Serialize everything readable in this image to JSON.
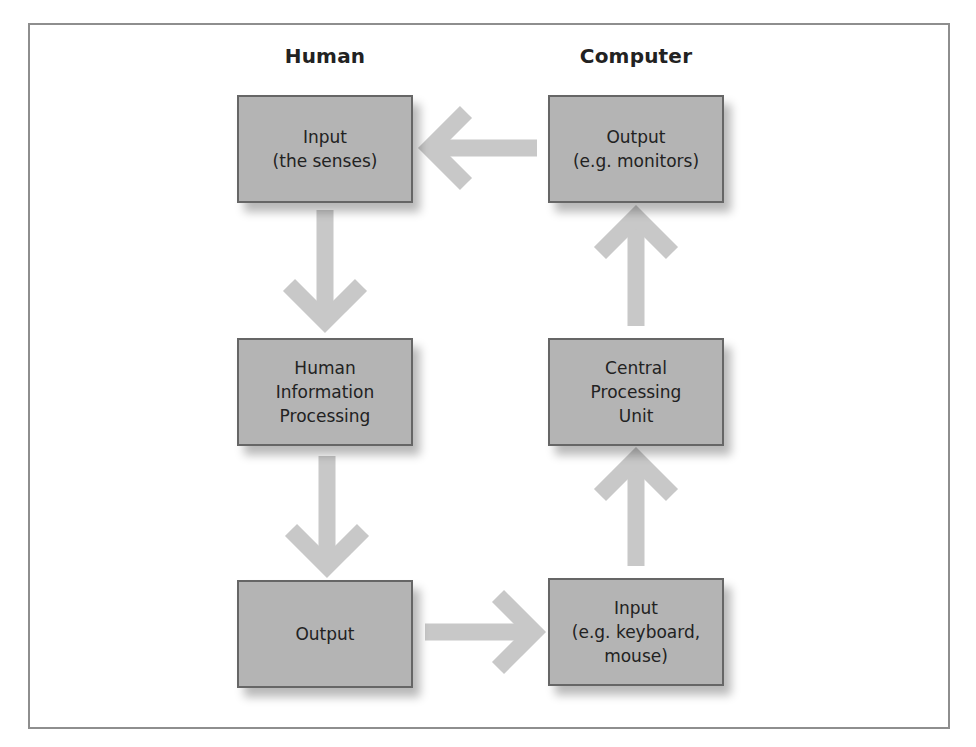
{
  "diagram": {
    "type": "flow-diagram",
    "columns": {
      "left": "Human",
      "right": "Computer"
    },
    "nodes": [
      {
        "id": "human-input",
        "column": "left",
        "row": 1,
        "label": "Input\n(the senses)"
      },
      {
        "id": "computer-output",
        "column": "right",
        "row": 1,
        "label": "Output\n(e.g. monitors)"
      },
      {
        "id": "human-processing",
        "column": "left",
        "row": 2,
        "label": "Human\nInformation\nProcessing"
      },
      {
        "id": "computer-cpu",
        "column": "right",
        "row": 2,
        "label": "Central\nProcessing\nUnit"
      },
      {
        "id": "human-output",
        "column": "left",
        "row": 3,
        "label": "Output"
      },
      {
        "id": "computer-input",
        "column": "right",
        "row": 3,
        "label": "Input\n(e.g. keyboard,\nmouse)"
      }
    ],
    "edges": [
      {
        "from": "human-input",
        "to": "human-processing",
        "direction": "down"
      },
      {
        "from": "human-processing",
        "to": "human-output",
        "direction": "down"
      },
      {
        "from": "human-output",
        "to": "computer-input",
        "direction": "right"
      },
      {
        "from": "computer-input",
        "to": "computer-cpu",
        "direction": "up"
      },
      {
        "from": "computer-cpu",
        "to": "computer-output",
        "direction": "up"
      },
      {
        "from": "computer-output",
        "to": "human-input",
        "direction": "left"
      }
    ],
    "colors": {
      "box_fill": "#b4b4b4",
      "box_border": "#666666",
      "arrow": "#c8c8c8",
      "frame_border": "#8e8e8e",
      "text": "#222222"
    }
  }
}
